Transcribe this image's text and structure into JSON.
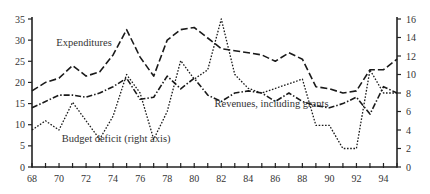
{
  "chart_data": {
    "type": "line",
    "title": "",
    "xlabel": "",
    "ylabel": "",
    "ylabel_right": "",
    "x": [
      68,
      69,
      70,
      71,
      72,
      73,
      74,
      75,
      76,
      77,
      78,
      79,
      80,
      81,
      82,
      83,
      84,
      85,
      86,
      87,
      88,
      89,
      90,
      91,
      92,
      93,
      94,
      95
    ],
    "x_ticks_labeled": [
      "68",
      "70",
      "72",
      "74",
      "76",
      "78",
      "80",
      "82",
      "84",
      "86",
      "88",
      "90",
      "92",
      "94"
    ],
    "ylim": [
      0,
      35
    ],
    "y_ticks": [
      "0",
      "5",
      "10",
      "15",
      "20",
      "25",
      "30",
      "35"
    ],
    "ylim_right": [
      0,
      16
    ],
    "y_ticks_right": [
      "0",
      "2",
      "4",
      "6",
      "8",
      "10",
      "12",
      "14",
      "16"
    ],
    "grid": false,
    "legend": "inline annotations",
    "series": [
      {
        "name": "Expenditures",
        "axis": "left",
        "style": "dashed",
        "values": [
          18,
          20,
          21,
          24,
          21.5,
          22.5,
          26.5,
          32.5,
          26,
          21.5,
          30,
          32.5,
          33,
          30.5,
          28,
          27.5,
          27,
          26.5,
          25,
          27,
          25.5,
          19,
          18.5,
          17.5,
          18,
          23,
          23,
          25.5
        ]
      },
      {
        "name": "Revenues, including grants",
        "axis": "left",
        "style": "dash-dot",
        "values": [
          14,
          15.5,
          17,
          17,
          16.5,
          17.5,
          19,
          21,
          16,
          16.5,
          21.5,
          18.5,
          21,
          17,
          15.5,
          17.5,
          18,
          17.5,
          15.5,
          17.5,
          15.5,
          14.5,
          14,
          15,
          16.5,
          12.5,
          19,
          17.5
        ]
      },
      {
        "name": "Budget deficit (right axis)",
        "axis": "right",
        "style": "dotted",
        "values": [
          4,
          5,
          4,
          7,
          5,
          3,
          5.5,
          10,
          8,
          3,
          6,
          11.5,
          9.5,
          10.5,
          16,
          10,
          8.5,
          8,
          8.5,
          9,
          9.5,
          4.5,
          4.5,
          2,
          2,
          10.5,
          8,
          8
        ]
      }
    ],
    "annotations": [
      {
        "text": "Expenditures",
        "x": 69.8,
        "y": 28.5
      },
      {
        "text": "Revenues, including grants",
        "x": 81.5,
        "y": 14.2
      },
      {
        "text": "Budget deficit (right axis)",
        "x": 70.2,
        "y": 5.8
      }
    ]
  },
  "labels": {
    "expenditures": "Expenditures",
    "revenues": "Revenues, including grants",
    "deficit": "Budget deficit (right axis)"
  }
}
